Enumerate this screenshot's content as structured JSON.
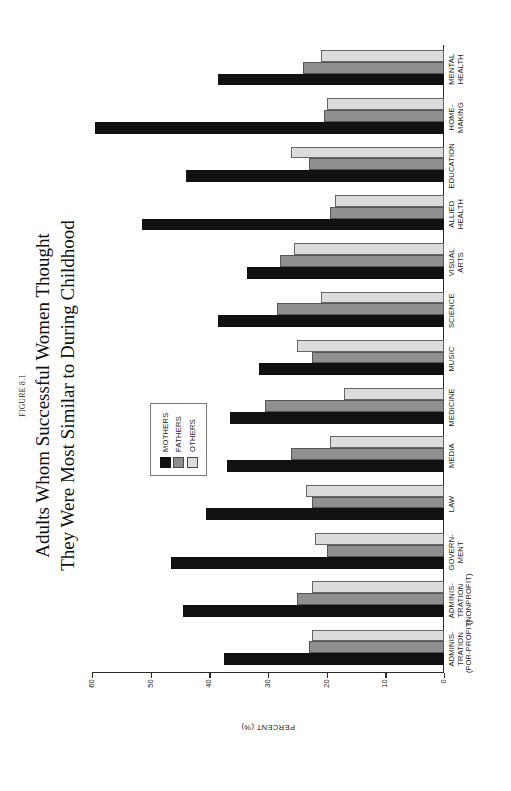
{
  "figure": {
    "number": "FIGURE 8.1",
    "title_line1": "Adults Whom Successful Women Thought",
    "title_line2": "They Were Most Similar to During Childhood"
  },
  "legend": {
    "position": "inside-left",
    "entries": [
      {
        "label": "MOTHERS",
        "color": "#111111",
        "key": "mothers"
      },
      {
        "label": "FATHERS",
        "color": "#8f8f8f",
        "key": "fathers"
      },
      {
        "label": "OTHERS",
        "color": "#dcdcdc",
        "key": "others"
      }
    ]
  },
  "axes": {
    "y_title": "PERCENT (%)",
    "y_ticks": [
      "0",
      "10",
      "20",
      "30",
      "40",
      "50",
      "60"
    ]
  },
  "chart_data": {
    "type": "bar",
    "title": "Adults Whom Successful Women Thought They Were Most Similar to During Childhood",
    "subtitle": "FIGURE 8.1",
    "xlabel": "",
    "ylabel": "PERCENT (%)",
    "ylim": [
      0,
      60
    ],
    "yticks": [
      0,
      10,
      20,
      30,
      40,
      50,
      60
    ],
    "grid": false,
    "legend_position": "inside-left",
    "orientation": "vertical-bars-rotated-page",
    "categories": [
      "ADMINIS-\nTRATION\n(FOR-PROFIT)",
      "ADMINIS-\nTRATION\n(NONPROFIT)",
      "GOVERN-\nMENT",
      "LAW",
      "MEDIA",
      "MEDICINE",
      "MUSIC",
      "SCIENCE",
      "VISUAL\nARTS",
      "ALLIED\nHEALTH",
      "EDUCATION",
      "HOME-\nMAKING",
      "MENTAL\nHEALTH"
    ],
    "category_lines": [
      [
        "ADMINIS-",
        "TRATION",
        "(FOR-PROFIT)"
      ],
      [
        "ADMINIS-",
        "TRATION",
        "(NONPROFIT)"
      ],
      [
        "GOVERN-",
        "MENT"
      ],
      [
        "LAW"
      ],
      [
        "MEDIA"
      ],
      [
        "MEDICINE"
      ],
      [
        "MUSIC"
      ],
      [
        "SCIENCE"
      ],
      [
        "VISUAL",
        "ARTS"
      ],
      [
        "ALLIED",
        "HEALTH"
      ],
      [
        "EDUCATION"
      ],
      [
        "HOME-",
        "MAKING"
      ],
      [
        "MENTAL",
        "HEALTH"
      ]
    ],
    "series": [
      {
        "name": "MOTHERS",
        "color": "#111111",
        "values": [
          37.5,
          44.5,
          46.5,
          40.5,
          37.0,
          36.5,
          31.5,
          38.5,
          33.5,
          51.5,
          44.0,
          59.5,
          38.5
        ]
      },
      {
        "name": "FATHERS",
        "color": "#8f8f8f",
        "values": [
          23.0,
          25.0,
          20.0,
          22.5,
          26.0,
          30.5,
          22.5,
          28.5,
          28.0,
          19.5,
          23.0,
          20.5,
          24.0
        ]
      },
      {
        "name": "OTHERS",
        "color": "#dcdcdc",
        "values": [
          22.5,
          22.5,
          22.0,
          23.5,
          19.5,
          17.0,
          25.0,
          21.0,
          25.5,
          18.5,
          26.0,
          20.0,
          21.0
        ]
      }
    ]
  }
}
